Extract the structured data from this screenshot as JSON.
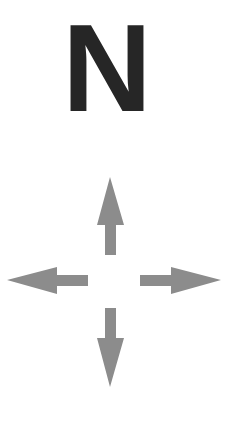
{
  "compass": {
    "label": "N",
    "label_color": "#262626",
    "arrow_color": "#8c8c8c",
    "arrows": [
      "up",
      "down",
      "left",
      "right"
    ]
  }
}
